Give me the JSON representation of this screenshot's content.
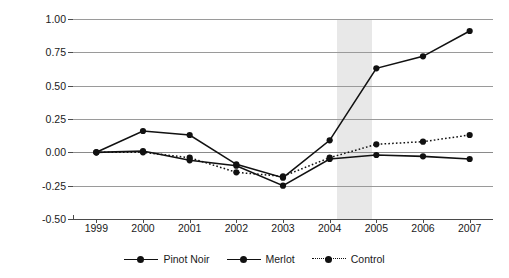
{
  "chart_data": {
    "type": "line",
    "title": "",
    "xlabel": "",
    "ylabel": "Indexed case volume (%)",
    "categories": [
      "1999",
      "2000",
      "2001",
      "2002",
      "2003",
      "2004",
      "2005",
      "2006",
      "2007"
    ],
    "x": [
      1999,
      2000,
      2001,
      2002,
      2003,
      2004,
      2005,
      2006,
      2007
    ],
    "ylim": [
      -0.5,
      1.0
    ],
    "ytick_labels": [
      "1.00",
      "0.75",
      "0.50",
      "0.25",
      "0.00",
      "-0.25",
      "-0.50"
    ],
    "ytick_values": [
      1.0,
      0.75,
      0.5,
      0.25,
      0.0,
      -0.25,
      -0.5
    ],
    "grid": true,
    "legend_position": "bottom",
    "series": [
      {
        "name": "Pinot Noir",
        "style": "solid",
        "marker": "circle",
        "color": "#111111",
        "values": [
          0.0,
          0.16,
          0.13,
          -0.09,
          -0.19,
          0.09,
          0.63,
          0.72,
          0.91
        ]
      },
      {
        "name": "Merlot",
        "style": "solid",
        "marker": "circle",
        "color": "#111111",
        "values": [
          0.0,
          0.01,
          -0.06,
          -0.1,
          -0.25,
          -0.05,
          -0.02,
          -0.03,
          -0.05
        ]
      },
      {
        "name": "Control",
        "style": "dotted",
        "marker": "circle",
        "color": "#111111",
        "values": [
          0.0,
          0.0,
          -0.04,
          -0.15,
          -0.18,
          -0.04,
          0.06,
          0.08,
          0.13
        ]
      }
    ],
    "annotations": [
      {
        "type": "shaded-band",
        "label": "highlighted period",
        "x_start": 2004.15,
        "x_end": 2004.9,
        "color": "#e8e8e8"
      }
    ]
  },
  "legend": {
    "items": [
      {
        "label": "Pinot Noir",
        "style": "solid"
      },
      {
        "label": "Merlot",
        "style": "solid"
      },
      {
        "label": "Control",
        "style": "dotted"
      }
    ]
  }
}
